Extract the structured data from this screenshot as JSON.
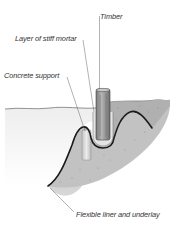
{
  "diagram": {
    "type": "cross-section illustration",
    "labels": [
      {
        "id": "timber",
        "text": "Timber",
        "x": 100,
        "y": 13
      },
      {
        "id": "mortar",
        "text": "Layer of stiff mortar",
        "x": 15,
        "y": 35
      },
      {
        "id": "concrete",
        "text": "Concrete support",
        "x": 4,
        "y": 72
      },
      {
        "id": "liner",
        "text": "Flexible liner and underlay",
        "x": 76,
        "y": 211
      }
    ],
    "colors": {
      "liner": "#1a1a1a",
      "soil": "#b8b8b8",
      "soil_dark": "#8a8a8a",
      "timber": "#9a9a9a",
      "concrete": "#d6d6d6",
      "leader": "#555555"
    }
  }
}
